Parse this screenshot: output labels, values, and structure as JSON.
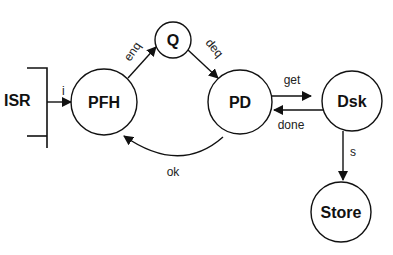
{
  "diagram": {
    "source": {
      "label": "ISR"
    },
    "nodes": [
      {
        "id": "pfh",
        "label": "PFH"
      },
      {
        "id": "q",
        "label": "Q"
      },
      {
        "id": "pd",
        "label": "PD"
      },
      {
        "id": "dsk",
        "label": "Dsk"
      },
      {
        "id": "store",
        "label": "Store"
      }
    ],
    "edges": [
      {
        "from": "ISR",
        "to": "PFH",
        "label": "i"
      },
      {
        "from": "PFH",
        "to": "Q",
        "label": "enq"
      },
      {
        "from": "Q",
        "to": "PD",
        "label": "deq"
      },
      {
        "from": "PD",
        "to": "Dsk",
        "label": "get"
      },
      {
        "from": "Dsk",
        "to": "PD",
        "label": "done"
      },
      {
        "from": "PD",
        "to": "PFH",
        "label": "ok"
      },
      {
        "from": "Dsk",
        "to": "Store",
        "label": "s"
      }
    ]
  }
}
